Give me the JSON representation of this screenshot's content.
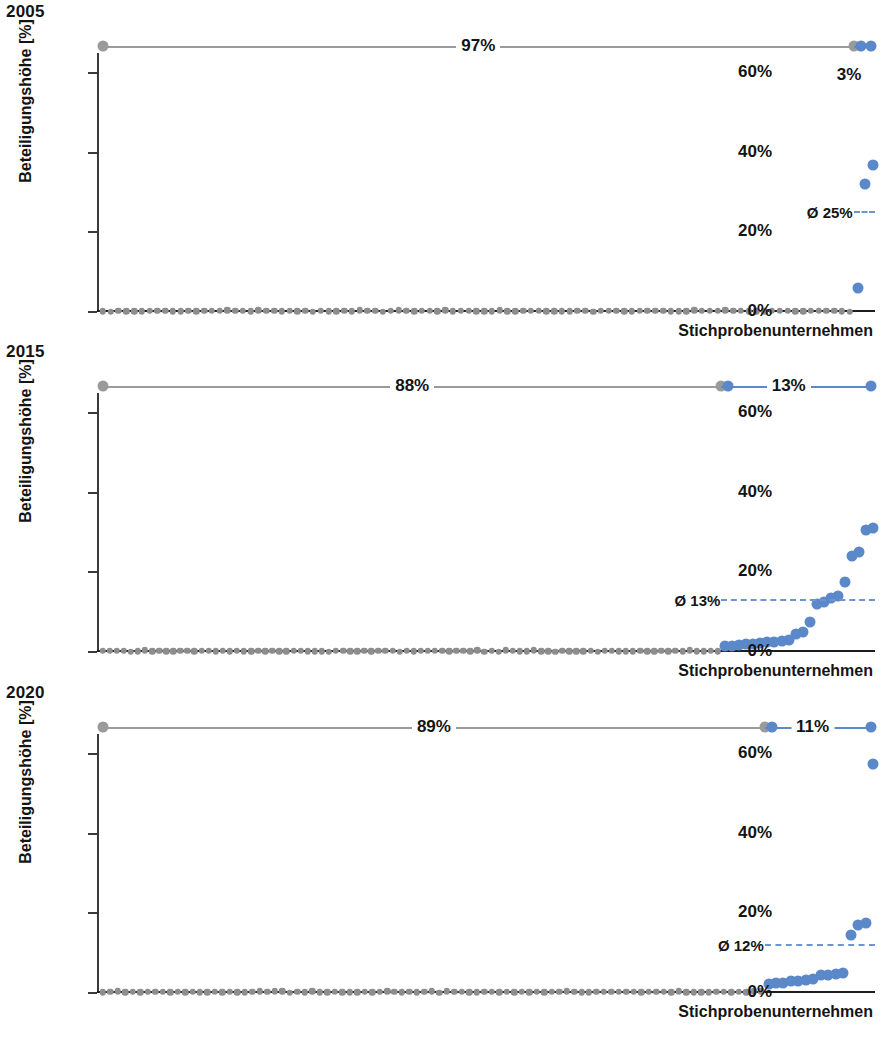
{
  "figure": {
    "axis_label_y": "Beteiligungshöhe [%]",
    "axis_label_x": "Stichprobenunternehmen",
    "y_ticks": [
      "0%",
      "20%",
      "40%",
      "60%"
    ],
    "colors": {
      "blue": "#5b88c8",
      "grey": "#8d8d8d",
      "axis": "#1d1d1d",
      "avg_dash": "#6d96d0"
    }
  },
  "chart_data": [
    {
      "type": "scatter",
      "title": "2005",
      "xlabel": "Stichprobenunternehmen",
      "ylabel": "Beteiligungshöhe [%]",
      "ylim": [
        0,
        65
      ],
      "yticks": [
        0,
        20,
        40,
        60
      ],
      "grid": false,
      "annotations": {
        "share_zero_label": "97%",
        "share_nonzero_label": "3%",
        "average_label": "Ø 25%",
        "average_value": 25,
        "share_zero_pct": 97,
        "share_nonzero_pct": 3
      },
      "series": [
        {
          "name": "Unternehmen ohne Beteiligung (0 %)",
          "color": "#8d8d8d",
          "count": 97,
          "values_pct": 0
        },
        {
          "name": "Unternehmen mit Beteiligung",
          "color": "#5b88c8",
          "values_pct": [
            6,
            32,
            37
          ]
        }
      ]
    },
    {
      "type": "scatter",
      "title": "2015",
      "xlabel": "Stichprobenunternehmen",
      "ylabel": "Beteiligungshöhe [%]",
      "ylim": [
        0,
        65
      ],
      "yticks": [
        0,
        20,
        40,
        60
      ],
      "grid": false,
      "annotations": {
        "share_zero_label": "88%",
        "share_nonzero_label": "13%",
        "average_label": "Ø 13%",
        "average_value": 13,
        "share_zero_pct": 88,
        "share_nonzero_pct": 13
      },
      "series": [
        {
          "name": "Unternehmen ohne Beteiligung (0 %)",
          "color": "#8d8d8d",
          "count": 88,
          "values_pct": 0
        },
        {
          "name": "Unternehmen mit Beteiligung",
          "color": "#5b88c8",
          "values_pct": [
            1.5,
            1.6,
            1.8,
            2.0,
            2.1,
            2.3,
            2.5,
            2.6,
            2.8,
            3.0,
            4.5,
            5.0,
            7.5,
            12.0,
            12.5,
            13.5,
            14.0,
            17.5,
            24.0,
            25.0,
            30.5,
            31.0
          ]
        }
      ]
    },
    {
      "type": "scatter",
      "title": "2020",
      "xlabel": "Stichprobenunternehmen",
      "ylabel": "Beteiligungshöhe [%]",
      "ylim": [
        0,
        65
      ],
      "yticks": [
        0,
        20,
        40,
        60
      ],
      "grid": false,
      "annotations": {
        "share_zero_label": "89%",
        "share_nonzero_label": "11%",
        "average_label": "Ø 12%",
        "average_value": 12,
        "share_zero_pct": 89,
        "share_nonzero_pct": 11
      },
      "series": [
        {
          "name": "Unternehmen ohne Beteiligung (0 %)",
          "color": "#8d8d8d",
          "count": 89,
          "values_pct": 0
        },
        {
          "name": "Unternehmen mit Beteiligung",
          "color": "#5b88c8",
          "values_pct": [
            2.3,
            2.5,
            2.6,
            3.0,
            3.1,
            3.2,
            3.4,
            4.5,
            4.6,
            4.8,
            5.0,
            14.5,
            17.0,
            17.5,
            57.5
          ]
        }
      ]
    }
  ]
}
